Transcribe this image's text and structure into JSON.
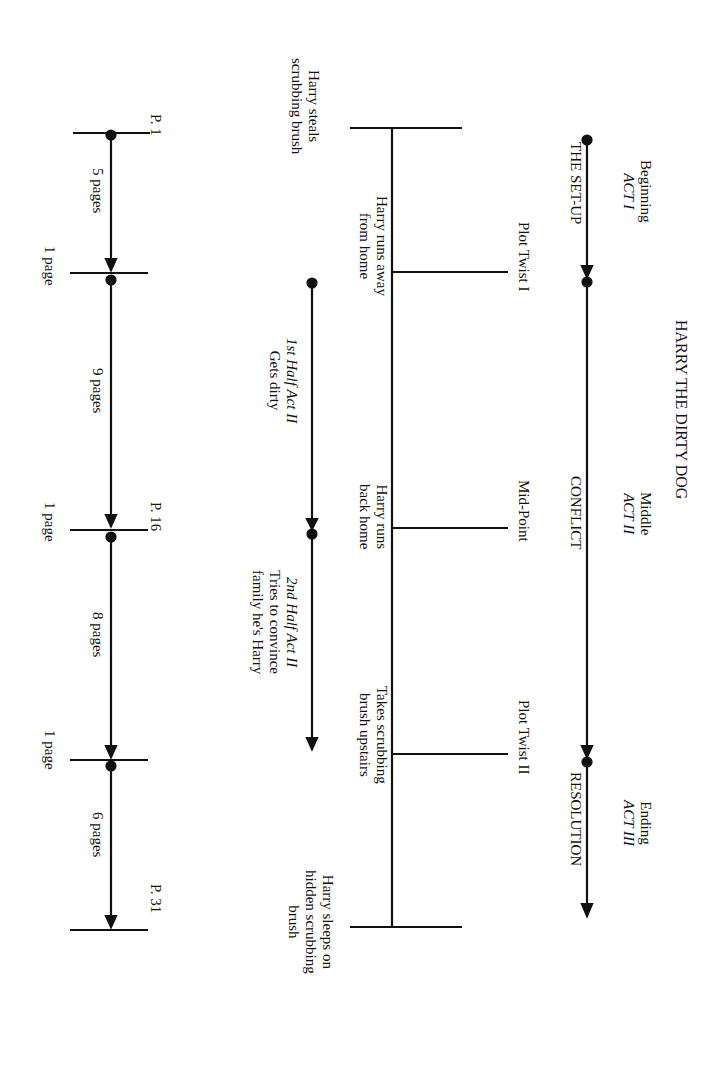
{
  "title": "HARRY THE DIRTY DOG",
  "acts": [
    {
      "name": "Beginning",
      "act": "ACT I",
      "phase": "THE SET-UP"
    },
    {
      "name": "Middle",
      "act": "ACT II",
      "phase": "CONFLICT"
    },
    {
      "name": "Ending",
      "act": "ACT III",
      "phase": "RESOLUTION"
    }
  ],
  "turning_points": [
    {
      "label": "Plot Twist I",
      "event": [
        "Harry runs away",
        "from home"
      ]
    },
    {
      "label": "Mid-Point",
      "event": [
        "Harry runs",
        "back home"
      ]
    },
    {
      "label": "Plot Twist II",
      "event": [
        "Takes scrubbing",
        "brush upstairs"
      ]
    }
  ],
  "start_event": [
    "Harry steals",
    "scrubbing brush"
  ],
  "end_event": [
    "Harry sleeps on",
    "hidden scrubbing",
    "brush"
  ],
  "act2_halves": [
    {
      "label": "1st Half Act II",
      "desc": [
        "Gets dirty"
      ]
    },
    {
      "label": "2nd Half Act II",
      "desc": [
        "Tries to convince",
        "family he's Harry"
      ]
    }
  ],
  "page_markers": {
    "start": "P. 1",
    "mid": "P. 16",
    "end": "P. 31"
  },
  "segments": [
    "5 pages",
    "9 pages",
    "8 pages",
    "6 pages"
  ],
  "transitions": [
    "1 page",
    "1 page",
    "1 page"
  ],
  "colors": {
    "ink": "#111111",
    "background": "#ffffff"
  }
}
